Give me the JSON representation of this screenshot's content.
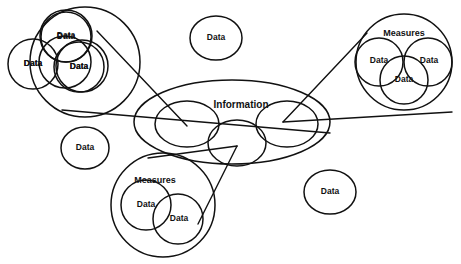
{
  "diagram": {
    "stroke_color": "#111111",
    "fill_color": "#ffffff",
    "background": "#ffffff",
    "labels": {
      "data": "Data",
      "measures": "Measures",
      "information": "Information"
    },
    "clusters": [
      {
        "id": "top-left-data-cluster",
        "label": "",
        "members": [
          "Data",
          "Data",
          "Data"
        ],
        "cx": 85,
        "cy": 62,
        "r": 55
      },
      {
        "id": "right-measures-cluster",
        "label": "Measures",
        "members": [
          "Data",
          "Data",
          "Data"
        ],
        "cx": 404,
        "cy": 62,
        "r": 48
      },
      {
        "id": "bottom-measures-cluster",
        "label": "Measures",
        "members": [
          "Data",
          "Data"
        ],
        "cx": 163,
        "cy": 205,
        "r": 52
      }
    ],
    "information_group": {
      "label": "Information",
      "cx": 232,
      "cy": 122,
      "rx": 98,
      "ry": 42,
      "slots": [
        "",
        "",
        ""
      ]
    },
    "standalone_nodes": [
      {
        "id": "standalone-data-top",
        "label": "Data",
        "cx": 216,
        "cy": 38,
        "rx": 26,
        "ry": 22
      },
      {
        "id": "standalone-data-left",
        "label": "Data",
        "cx": 85,
        "cy": 148,
        "rx": 24,
        "ry": 21
      },
      {
        "id": "standalone-data-bottom-right",
        "label": "Data",
        "cx": 330,
        "cy": 192,
        "rx": 26,
        "ry": 22
      }
    ],
    "connector_count": 6
  }
}
